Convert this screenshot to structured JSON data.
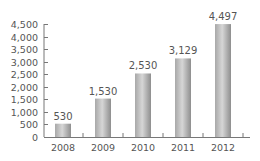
{
  "chart_data": {
    "type": "bar",
    "title": "",
    "xlabel": "",
    "ylabel": "",
    "categories": [
      "2008",
      "2009",
      "2010",
      "2011",
      "2012"
    ],
    "values": [
      530,
      1530,
      2530,
      3129,
      4497
    ],
    "value_labels": [
      "530",
      "1,530",
      "2,530",
      "3,129",
      "4,497"
    ],
    "ylim": [
      0,
      4500
    ],
    "yticks": [
      0,
      500,
      1000,
      1500,
      2000,
      2500,
      3000,
      3500,
      4000,
      4500
    ],
    "ytick_labels": [
      "0",
      "500",
      "1,000",
      "1,500",
      "2,000",
      "2,500",
      "3,000",
      "3,500",
      "4,000",
      "4,500"
    ],
    "grid": false,
    "legend": null,
    "colors": {
      "bar_light": "#d4d4d4",
      "bar_dark": "#8e8e8e",
      "axis": "#777777",
      "text": "#555555"
    }
  }
}
